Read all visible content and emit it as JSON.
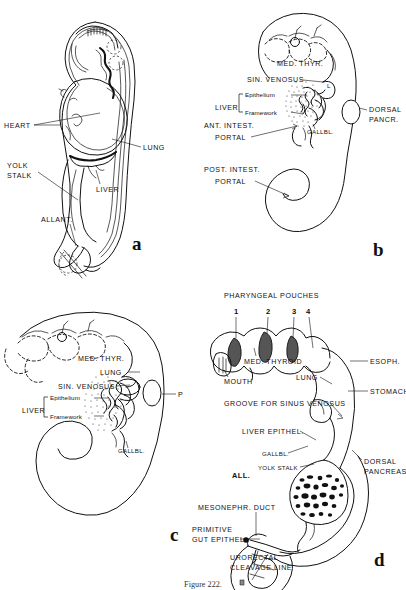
{
  "figure": {
    "type": "anatomical-line-drawing-plate",
    "background": "#ffffff",
    "ink_color": "#111111",
    "panel_count": 4,
    "caption_partial": "Figure 222."
  },
  "panels": [
    {
      "id": "a",
      "letter": "a",
      "position": "top-left",
      "description": "Lateral view of whole embryo showing heart, liver, lung, yolk stalk and allantois",
      "labels": [
        {
          "name": "heart",
          "text": "HEART",
          "side": "left"
        },
        {
          "name": "yolk-stalk",
          "text": "YOLK",
          "text2": "STALK",
          "side": "left"
        },
        {
          "name": "allantois",
          "text": "ALLANT.",
          "side": "left"
        },
        {
          "name": "lung",
          "text": "LUNG",
          "side": "right"
        },
        {
          "name": "liver",
          "text": "LIVER",
          "side": "right"
        }
      ]
    },
    {
      "id": "b",
      "letter": "b",
      "position": "top-right",
      "description": "Embryo outline with medial thyroid, sinus venosus, liver epithelium and framework, gallbladder, intestinal portals and dorsal pancreas",
      "labels": [
        {
          "name": "med-thyroid",
          "text": "MED. THYR."
        },
        {
          "name": "sinus-venosus",
          "text": "SIN. VENOSUS"
        },
        {
          "name": "liver",
          "text": "LIVER"
        },
        {
          "name": "liver-epithelium",
          "text": "Epithelium"
        },
        {
          "name": "liver-framework",
          "text": "Framework"
        },
        {
          "name": "ant-intest-portal",
          "text": "ANT. INTEST.",
          "text2": "PORTAL"
        },
        {
          "name": "post-intest-portal",
          "text": "POST. INTEST.",
          "text2": "PORTAL"
        },
        {
          "name": "gallbladder",
          "text": "GALLBL."
        },
        {
          "name": "dorsal-pancreas",
          "text": "DORSAL",
          "text2": "PANCR."
        },
        {
          "name": "lung-bud",
          "text": "L"
        }
      ]
    },
    {
      "id": "c",
      "letter": "c",
      "position": "bottom-left",
      "description": "Gut outline with pharyngeal arches dashed, medial thyroid, lung, sinus venosus, liver epithelium and framework, gallbladder, pancreas",
      "labels": [
        {
          "name": "med-thyroid",
          "text": "MED. THYR."
        },
        {
          "name": "lung",
          "text": "LUNG"
        },
        {
          "name": "sinus-venosus",
          "text": "SIN. VENOSUS"
        },
        {
          "name": "liver",
          "text": "LIVER"
        },
        {
          "name": "liver-epithelium",
          "text": "Epithelium"
        },
        {
          "name": "liver-framework",
          "text": "Framework"
        },
        {
          "name": "gallbladder",
          "text": "GALLBL."
        },
        {
          "name": "pancreas",
          "text": "P"
        }
      ]
    },
    {
      "id": "d",
      "letter": "d",
      "position": "bottom-right",
      "description": "Detailed gut epithelium model with numbered pharyngeal pouches, mouth, thyroid, lung, esophagus, stomach, liver epithelium, gallbladder, yolk stalk, allantois, dorsal pancreas, mesonephric duct and urorectal cleavage line",
      "labels": [
        {
          "name": "pharyngeal-pouches",
          "text": "PHARYNGEAL POUCHES"
        },
        {
          "name": "pouch-number-1",
          "text": "1"
        },
        {
          "name": "pouch-number-2",
          "text": "2"
        },
        {
          "name": "pouch-number-3",
          "text": "3"
        },
        {
          "name": "pouch-number-4",
          "text": "4"
        },
        {
          "name": "med-thyroid",
          "text": "MED. THYROID"
        },
        {
          "name": "mouth",
          "text": "MOUTH"
        },
        {
          "name": "lung",
          "text": "LUNG"
        },
        {
          "name": "esophagus",
          "text": "ESOPH."
        },
        {
          "name": "stomach",
          "text": "STOMACH"
        },
        {
          "name": "groove-sinus-venosus",
          "text": "GROOVE FOR SINUS VENOSUS"
        },
        {
          "name": "liver-epithel",
          "text": "LIVER EPITHEL."
        },
        {
          "name": "gallbladder",
          "text": "GALLBL."
        },
        {
          "name": "yolk-stalk",
          "text": "YOLK STALK"
        },
        {
          "name": "allantois",
          "text": "ALL."
        },
        {
          "name": "dorsal-pancreas",
          "text": "DORSAL",
          "text2": "PANCREAS"
        },
        {
          "name": "mesonephric-duct",
          "text": "MESONEPHR. DUCT"
        },
        {
          "name": "primitive-gut-epithel",
          "text": "PRIMITIVE",
          "text2": "GUT EPITHEL."
        },
        {
          "name": "urorectal-cleavage-line",
          "text": "URORECTAL",
          "text2": "CLEAVAGE LINE"
        }
      ]
    }
  ]
}
